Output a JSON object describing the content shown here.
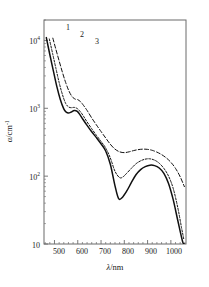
{
  "figure": {
    "background": "#ffffff",
    "frame_color": "#6b6b6b",
    "curve_color": "#101010"
  },
  "axes": {
    "x": {
      "label_var": "λ",
      "label_unit": "nm",
      "label_full": "λ/nm",
      "ticks": [
        "500",
        "600",
        "700",
        "800",
        "900",
        "1000"
      ],
      "tick_values": [
        500,
        600,
        700,
        800,
        900,
        1000
      ],
      "range": [
        455,
        1065
      ],
      "minor_tick_step": 20
    },
    "y": {
      "label_var": "α",
      "label_unit": "cm",
      "label_exp": "-1",
      "label_full": "α/cm⁻¹",
      "ticks": [
        {
          "mantissa": "10",
          "exponent": "4",
          "value": 10000
        },
        {
          "mantissa": "10",
          "exponent": "3",
          "value": 1000
        },
        {
          "mantissa": "10",
          "exponent": "2",
          "value": 100
        },
        {
          "mantissa": "10",
          "exponent": "",
          "value": 10
        }
      ],
      "range": [
        10,
        20000
      ],
      "scale": "log"
    }
  },
  "curve_labels": [
    {
      "text": "1",
      "x": 66,
      "y": 24
    },
    {
      "text": "2",
      "x": 80,
      "y": 31
    },
    {
      "text": "3",
      "x": 95,
      "y": 38
    }
  ],
  "chart_data": {
    "type": "line",
    "title": "",
    "subtitle": "",
    "xlabel": "λ/nm",
    "ylabel": "α/cm⁻¹",
    "xlim": [
      455,
      1065
    ],
    "ylim": [
      10,
      20000
    ],
    "yscale": "log",
    "xscale": "linear",
    "grid": false,
    "legend": "inline-curve-numbers",
    "legend_position": "top-left",
    "annotations": [
      "1",
      "2",
      "3"
    ],
    "series": [
      {
        "name": "1",
        "style": "solid",
        "x": [
          465,
          480,
          495,
          510,
          525,
          540,
          550,
          560,
          572,
          585,
          598,
          610,
          622,
          640,
          660,
          680,
          700,
          720,
          740,
          760,
          775,
          790,
          810,
          830,
          850,
          870,
          890,
          910,
          930,
          950,
          970,
          990,
          1010,
          1030,
          1050,
          1058
        ],
        "y": [
          11000,
          6200,
          3600,
          2100,
          1350,
          980,
          880,
          850,
          880,
          930,
          900,
          800,
          690,
          560,
          450,
          370,
          300,
          235,
          150,
          72,
          47,
          48,
          60,
          80,
          105,
          125,
          138,
          145,
          143,
          132,
          110,
          78,
          45,
          22,
          11,
          9.5
        ]
      },
      {
        "name": "2",
        "style": "dashed-short",
        "x": [
          478,
          492,
          506,
          520,
          534,
          548,
          560,
          572,
          585,
          598,
          610,
          622,
          640,
          660,
          680,
          700,
          720,
          740,
          760,
          780,
          795,
          810,
          830,
          850,
          870,
          890,
          910,
          930,
          950,
          970,
          990,
          1010,
          1030,
          1045,
          1055
        ],
        "y": [
          10500,
          6400,
          3900,
          2400,
          1600,
          1180,
          1050,
          1020,
          1030,
          990,
          900,
          790,
          630,
          500,
          400,
          325,
          260,
          185,
          118,
          95,
          98,
          110,
          130,
          152,
          168,
          178,
          180,
          172,
          155,
          130,
          100,
          66,
          34,
          18,
          12
        ]
      },
      {
        "name": "3",
        "style": "dashed-long",
        "x": [
          493,
          506,
          520,
          534,
          548,
          562,
          576,
          590,
          600,
          612,
          625,
          640,
          660,
          680,
          700,
          720,
          740,
          760,
          780,
          800,
          820,
          840,
          860,
          880,
          900,
          920,
          940,
          960,
          980,
          1000,
          1020,
          1040,
          1058
        ],
        "y": [
          10800,
          7400,
          5000,
          3400,
          2400,
          1800,
          1480,
          1360,
          1340,
          1250,
          1100,
          930,
          720,
          570,
          455,
          365,
          295,
          250,
          228,
          222,
          228,
          238,
          246,
          250,
          248,
          240,
          226,
          208,
          186,
          160,
          130,
          98,
          70
        ]
      }
    ]
  }
}
